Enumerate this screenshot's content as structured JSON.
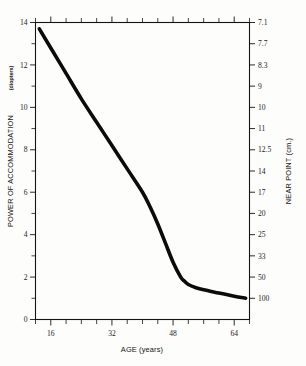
{
  "chart_data": {
    "type": "line",
    "title": "",
    "xlabel": "AGE (years)",
    "ylabel": "POWER OF ACCOMMODATION",
    "ylabel_units": "(diopters)",
    "y2label": "NEAR POINT (cm.)",
    "xlim": [
      12,
      68
    ],
    "ylim": [
      0,
      14
    ],
    "grid": false,
    "legend": "none",
    "x_ticks_labeled": [
      16,
      32,
      48,
      64
    ],
    "x_tick_labels": [
      "16",
      "32",
      "48",
      "64"
    ],
    "x_ticks_all": [
      12,
      16,
      20,
      24,
      28,
      32,
      36,
      40,
      44,
      48,
      52,
      56,
      60,
      64,
      68
    ],
    "y_ticks_labeled": [
      0,
      2,
      4,
      6,
      8,
      10,
      12,
      14
    ],
    "y_tick_labels": [
      "0",
      "2",
      "4",
      "6",
      "8",
      "10",
      "12",
      "14"
    ],
    "y_ticks_minor": [
      1,
      3,
      5,
      7,
      9,
      11,
      13
    ],
    "y2_tick_values_diopters": [
      14,
      13,
      12,
      11,
      10,
      9,
      8,
      7,
      6,
      5,
      4,
      3,
      2,
      1
    ],
    "y2_tick_labels": [
      "7.1",
      "7.7",
      "8.3",
      "9",
      "10",
      "11",
      "12.5",
      "14",
      "17",
      "20",
      "25",
      "33",
      "50",
      "100"
    ],
    "series": [
      {
        "name": "Accommodation amplitude",
        "x": [
          13,
          16,
          20,
          24,
          28,
          32,
          36,
          40,
          42,
          44,
          46,
          48,
          50,
          51,
          52,
          54,
          56,
          60,
          64,
          67
        ],
        "values": [
          13.7,
          12.8,
          11.6,
          10.4,
          9.3,
          8.2,
          7.1,
          6.0,
          5.3,
          4.5,
          3.6,
          2.7,
          2.0,
          1.8,
          1.65,
          1.5,
          1.4,
          1.25,
          1.1,
          1.0
        ]
      }
    ],
    "colors": {
      "curve": "#0b0b0b",
      "axis": "#141414",
      "background": "#fdfdfb"
    }
  },
  "axes": {
    "left": {
      "title": "POWER OF ACCOMMODATION",
      "units": "(diopters)"
    },
    "right": {
      "title": "NEAR POINT (cm.)"
    },
    "bottom": {
      "title": "AGE (years)"
    }
  }
}
